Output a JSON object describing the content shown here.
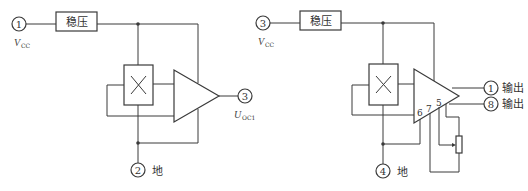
{
  "left_circuit": {
    "regulator_label": "稳压",
    "pins": [
      {
        "number": "1",
        "label_main": "V",
        "label_sub": "CC"
      },
      {
        "number": "2",
        "label_main": "地",
        "label_sub": ""
      },
      {
        "number": "3",
        "label_main": "U",
        "label_sub": "OC1"
      }
    ]
  },
  "right_circuit": {
    "regulator_label": "稳压",
    "pins": [
      {
        "number": "3",
        "label_main": "V",
        "label_sub": "CC"
      },
      {
        "number": "4",
        "label_main": "地",
        "label_sub": ""
      },
      {
        "number": "1",
        "label_main": "输出",
        "label_sub": ""
      },
      {
        "number": "8",
        "label_main": "输出",
        "label_sub": ""
      }
    ],
    "amp_pins": [
      "6",
      "7",
      "5"
    ]
  },
  "colors": {
    "line": "#3a3a3a",
    "background": "#ffffff"
  }
}
